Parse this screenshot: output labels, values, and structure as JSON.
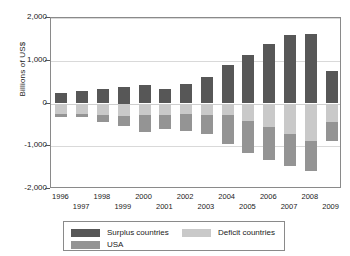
{
  "chart_data": {
    "type": "bar",
    "title": "",
    "subtitle": "",
    "xlabel": "",
    "ylabel": "Billions of US$",
    "ylim": [
      -2000,
      2000
    ],
    "yticks": [
      2000,
      1000,
      0,
      -1000,
      -2000
    ],
    "ytick_labels": [
      "2,000",
      "1,000",
      "0",
      "-1,000",
      "-2,000"
    ],
    "grid": true,
    "stacked": true,
    "legend_position": "below-plot",
    "categories": [
      "1996",
      "1997",
      "1998",
      "1999",
      "2000",
      "2001",
      "2002",
      "2003",
      "2004",
      "2005",
      "2006",
      "2007",
      "2008",
      "2009"
    ],
    "series": [
      {
        "name": "Surplus countries",
        "color": "#575757",
        "values": [
          255,
          290,
          330,
          375,
          435,
          345,
          460,
          620,
          895,
          1140,
          1400,
          1605,
          1615,
          760
        ]
      },
      {
        "name": "Deficit countries",
        "color": "#c9c9c9",
        "values": [
          -235,
          -235,
          -265,
          -285,
          -280,
          -265,
          -250,
          -265,
          -280,
          -405,
          -540,
          -725,
          -880,
          -440
        ]
      },
      {
        "name": "USA",
        "color": "#949494",
        "values": [
          -70,
          -75,
          -175,
          -240,
          -385,
          -320,
          -390,
          -460,
          -660,
          -755,
          -790,
          -730,
          -695,
          -435
        ]
      }
    ],
    "series_note": "Deficit countries and USA are plotted below zero; Surplus countries above zero.",
    "totals_negative": [
      -305,
      -310,
      -440,
      -525,
      -665,
      -585,
      -640,
      -725,
      -940,
      -1160,
      -1330,
      -1455,
      -1575,
      -875
    ]
  },
  "axes": {
    "y_title": "Billions of US$",
    "y_tick_labels": [
      "2,000",
      "1,000",
      "0",
      "-1,000",
      "-2,000"
    ],
    "x_tick_labels_top": [
      "1996",
      "1998",
      "2000",
      "2002",
      "2004",
      "2006",
      "2008"
    ],
    "x_tick_labels_bottom": [
      "1997",
      "1999",
      "2001",
      "2003",
      "2005",
      "2007",
      "2009"
    ]
  },
  "legend": {
    "items": [
      {
        "label": "Surplus countries",
        "color": "#575757"
      },
      {
        "label": "Deficit countries",
        "color": "#c9c9c9"
      },
      {
        "label": "USA",
        "color": "#949494"
      }
    ]
  }
}
